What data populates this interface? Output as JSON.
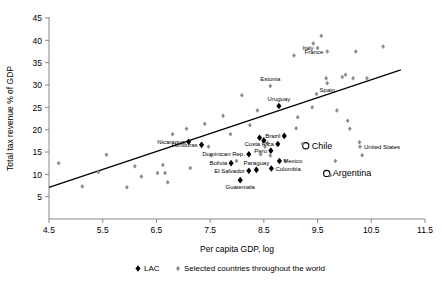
{
  "chart_data": {
    "type": "scatter",
    "title": "",
    "xlabel": "Per capita GDP, log",
    "ylabel": "Total tax revenue % of GDP",
    "xlim": [
      4.5,
      11.5
    ],
    "ylim": [
      0,
      45
    ],
    "xticks": [
      "4.5",
      "5.5",
      "6.5",
      "7.5",
      "8.5",
      "9.5",
      "10.5",
      "11.5"
    ],
    "xtick_values": [
      4.5,
      5.5,
      6.5,
      7.5,
      8.5,
      9.5,
      10.5,
      11.5
    ],
    "yticks": [
      "5",
      "10",
      "15",
      "20",
      "25",
      "30",
      "35",
      "40",
      "45"
    ],
    "ytick_values": [
      5,
      10,
      15,
      20,
      25,
      30,
      35,
      40,
      45
    ],
    "grid": false,
    "legend_position": "bottom",
    "trendline": {
      "x0": 4.5,
      "y0": 7.1,
      "x1": 11.05,
      "y1": 33.4,
      "color": "#000000"
    },
    "series": [
      {
        "name": "LAC",
        "marker": "filled-diamond",
        "color": "#000000",
        "points": [
          {
            "label": "Nicaragua",
            "x": 7.1,
            "y": 17.3,
            "label_pos": "left"
          },
          {
            "label": "Honduras",
            "x": 7.34,
            "y": 16.6,
            "label_pos": "left"
          },
          {
            "label": "Dominican Rep.",
            "x": 8.22,
            "y": 14.5,
            "label_pos": "left"
          },
          {
            "label": "Bolivia",
            "x": 7.89,
            "y": 12.5,
            "label_pos": "left"
          },
          {
            "label": "Paraguay",
            "x": 8.36,
            "y": 11.0,
            "label_pos": "above"
          },
          {
            "label": "El Salvador",
            "x": 8.22,
            "y": 10.8,
            "label_pos": "left"
          },
          {
            "label": "Guatemala",
            "x": 8.06,
            "y": 8.7,
            "label_pos": "below"
          },
          {
            "label": "Colombia",
            "x": 8.64,
            "y": 11.3,
            "label_pos": "right"
          },
          {
            "label": "Peru",
            "x": 8.63,
            "y": 15.3,
            "label_pos": "left"
          },
          {
            "label": "Mexico",
            "x": 8.79,
            "y": 13.0,
            "label_pos": "right"
          },
          {
            "label": "Costa Rica",
            "x": 8.76,
            "y": 16.8,
            "label_pos": "left"
          },
          {
            "label": "Brazil",
            "x": 8.88,
            "y": 18.6,
            "label_pos": "left"
          },
          {
            "label": "Uruguay",
            "x": 8.78,
            "y": 25.3,
            "label_pos": "above"
          },
          {
            "label": "",
            "x": 8.42,
            "y": 18.2,
            "label_pos": "none"
          },
          {
            "label": "",
            "x": 8.5,
            "y": 17.6,
            "label_pos": "none"
          }
        ]
      },
      {
        "name": "LAC-outlier",
        "marker": "open-circle",
        "color": "#000000",
        "points": [
          {
            "label": "Chile",
            "x": 9.28,
            "y": 16.4,
            "label_pos": "right"
          },
          {
            "label": "Argentina",
            "x": 9.67,
            "y": 10.2,
            "label_pos": "right"
          }
        ]
      },
      {
        "name": "Selected countries throughout the world",
        "marker": "small-diamond",
        "color": "#808080",
        "points": [
          {
            "label": "",
            "x": 4.68,
            "y": 12.5
          },
          {
            "label": "",
            "x": 5.12,
            "y": 7.3
          },
          {
            "label": "",
            "x": 5.57,
            "y": 14.4
          },
          {
            "label": "",
            "x": 5.42,
            "y": 10.5
          },
          {
            "label": "",
            "x": 5.95,
            "y": 7.1
          },
          {
            "label": "",
            "x": 6.1,
            "y": 11.8
          },
          {
            "label": "",
            "x": 6.22,
            "y": 9.5
          },
          {
            "label": "",
            "x": 6.52,
            "y": 10.3
          },
          {
            "label": "",
            "x": 6.66,
            "y": 10.3
          },
          {
            "label": "",
            "x": 6.71,
            "y": 8.2
          },
          {
            "label": "",
            "x": 6.8,
            "y": 19.0
          },
          {
            "label": "",
            "x": 6.62,
            "y": 12.1
          },
          {
            "label": "",
            "x": 7.06,
            "y": 20.2
          },
          {
            "label": "",
            "x": 7.13,
            "y": 11.4
          },
          {
            "label": "",
            "x": 7.4,
            "y": 21.3
          },
          {
            "label": "",
            "x": 7.47,
            "y": 16.2
          },
          {
            "label": "",
            "x": 7.52,
            "y": 14.2
          },
          {
            "label": "",
            "x": 7.74,
            "y": 23.1
          },
          {
            "label": "",
            "x": 7.88,
            "y": 19.0
          },
          {
            "label": "",
            "x": 7.99,
            "y": 13.0
          },
          {
            "label": "",
            "x": 8.09,
            "y": 27.7
          },
          {
            "label": "",
            "x": 8.24,
            "y": 21.0
          },
          {
            "label": "",
            "x": 8.38,
            "y": 24.3
          },
          {
            "label": "",
            "x": 8.44,
            "y": 14.5
          },
          {
            "label": "",
            "x": 8.57,
            "y": 17.0
          },
          {
            "label": "",
            "x": 8.52,
            "y": 16.2
          },
          {
            "label": "Estonia",
            "x": 8.62,
            "y": 29.8,
            "label_pos": "above"
          },
          {
            "label": "",
            "x": 8.62,
            "y": 14.2
          },
          {
            "label": "",
            "x": 8.9,
            "y": 13.0
          },
          {
            "label": "",
            "x": 9.1,
            "y": 20.3
          },
          {
            "label": "",
            "x": 9.13,
            "y": 22.8
          },
          {
            "label": "",
            "x": 9.06,
            "y": 36.6
          },
          {
            "label": "",
            "x": 9.22,
            "y": 16.8
          },
          {
            "label": "",
            "x": 9.4,
            "y": 25.0
          },
          {
            "label": "",
            "x": 9.48,
            "y": 28.0
          },
          {
            "label": "Italy",
            "x": 9.5,
            "y": 38.3,
            "label_pos": "left"
          },
          {
            "label": "",
            "x": 9.42,
            "y": 39.3
          },
          {
            "label": "France",
            "x": 9.68,
            "y": 37.5,
            "label_pos": "left"
          },
          {
            "label": "",
            "x": 9.57,
            "y": 41.0
          },
          {
            "label": "Spain",
            "x": 9.68,
            "y": 30.4,
            "label_pos": "below"
          },
          {
            "label": "",
            "x": 9.66,
            "y": 31.5
          },
          {
            "label": "",
            "x": 9.74,
            "y": 9.8
          },
          {
            "label": "",
            "x": 9.83,
            "y": 13.0
          },
          {
            "label": "",
            "x": 9.86,
            "y": 24.3
          },
          {
            "label": "",
            "x": 9.96,
            "y": 31.8
          },
          {
            "label": "",
            "x": 10.02,
            "y": 32.3
          },
          {
            "label": "",
            "x": 10.06,
            "y": 22.0
          },
          {
            "label": "",
            "x": 10.1,
            "y": 20.2
          },
          {
            "label": "",
            "x": 10.16,
            "y": 31.5
          },
          {
            "label": "",
            "x": 10.21,
            "y": 37.5
          },
          {
            "label": "",
            "x": 10.28,
            "y": 17.2
          },
          {
            "label": "United States",
            "x": 10.29,
            "y": 16.2,
            "label_pos": "right"
          },
          {
            "label": "",
            "x": 10.33,
            "y": 14.3
          },
          {
            "label": "",
            "x": 10.42,
            "y": 31.5
          },
          {
            "label": "",
            "x": 10.72,
            "y": 38.6
          }
        ]
      }
    ],
    "legend": [
      {
        "label": "LAC",
        "marker": "filled-diamond",
        "color": "#000000"
      },
      {
        "label": "Selected countries throughout the world",
        "marker": "small-diamond",
        "color": "#808080"
      }
    ]
  }
}
